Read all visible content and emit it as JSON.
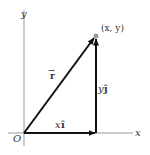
{
  "diagram": {
    "type": "vector-decomposition",
    "axes": {
      "x_label": "x",
      "y_label": "y",
      "origin_label": "O"
    },
    "point": {
      "label": "(x, y)",
      "color": "#999999"
    },
    "vectors": {
      "r": {
        "label": "r",
        "arrow": "→"
      },
      "x_component": {
        "coef": "x",
        "unit": "î"
      },
      "y_component": {
        "coef": "y",
        "unit": "ĵ"
      }
    },
    "colors": {
      "axis": "#999999",
      "vector": "#111111",
      "text": "#333333"
    }
  }
}
